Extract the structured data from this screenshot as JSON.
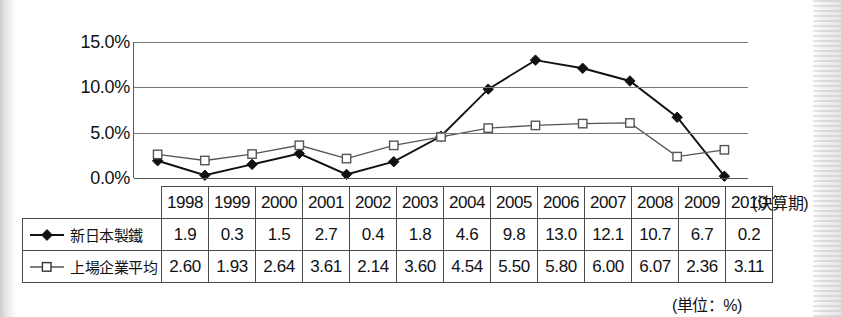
{
  "chart_data": {
    "type": "line",
    "title": "",
    "xlabel": "(決算期)",
    "ylabel": "",
    "unit_note": "(単位：%)",
    "categories": [
      "1998",
      "1999",
      "2000",
      "2001",
      "2002",
      "2003",
      "2004",
      "2005",
      "2006",
      "2007",
      "2008",
      "2009",
      "2010"
    ],
    "ytick_labels": [
      "15.0%",
      "10.0%",
      "5.0%",
      "0.0%"
    ],
    "ytick_values": [
      15.0,
      10.0,
      5.0,
      0.0
    ],
    "ylim": [
      0.0,
      15.0
    ],
    "grid": true,
    "legend_position": "table-left-column",
    "series": [
      {
        "name": "新日本製鐵",
        "marker": "filled-diamond",
        "color": "#111111",
        "values": [
          1.9,
          0.3,
          1.5,
          2.7,
          0.4,
          1.8,
          4.6,
          9.8,
          13.0,
          12.1,
          10.7,
          6.7,
          0.2
        ],
        "display_values": [
          "1.9",
          "0.3",
          "1.5",
          "2.7",
          "0.4",
          "1.8",
          "4.6",
          "9.8",
          "13.0",
          "12.1",
          "10.7",
          "6.7",
          "0.2"
        ]
      },
      {
        "name": "上場企業平均",
        "marker": "open-square",
        "color": "#555555",
        "values": [
          2.6,
          1.93,
          2.64,
          3.61,
          2.14,
          3.6,
          4.54,
          5.5,
          5.8,
          6.0,
          6.07,
          2.36,
          3.11
        ],
        "display_values": [
          "2.60",
          "1.93",
          "2.64",
          "3.61",
          "2.14",
          "3.60",
          "4.54",
          "5.50",
          "5.80",
          "6.00",
          "6.07",
          "2.36",
          "3.11"
        ]
      }
    ]
  }
}
